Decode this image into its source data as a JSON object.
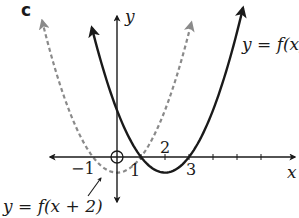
{
  "figure": {
    "panel_label": "c",
    "axes": {
      "x_label": "x",
      "y_label": "y",
      "origin_px": [
        117,
        157
      ],
      "unit_px": 24,
      "x_ticks": [
        1,
        2,
        3,
        4,
        5,
        6
      ],
      "x_tick_labels": [
        {
          "value": -1,
          "text": "−1"
        },
        {
          "value": 1,
          "text": "1"
        },
        {
          "value": 2,
          "text": "2"
        },
        {
          "value": 3,
          "text": "3"
        }
      ],
      "origin_marker": "circle"
    },
    "curves": [
      {
        "name": "f",
        "label": "y = f(x)",
        "style": "solid",
        "color": "#1a1a1a",
        "roots": [
          1,
          3
        ],
        "vertex": [
          2,
          -0.65
        ],
        "a": 0.65,
        "x_range": [
          -1.05,
          5.25
        ]
      },
      {
        "name": "f-shifted",
        "label": "y = f(x + 2)",
        "style": "dashed",
        "color": "#8a8a8a",
        "roots": [
          -1,
          1
        ],
        "vertex": [
          0,
          -0.65
        ],
        "a": 0.65,
        "x_range": [
          -3.12,
          3.1
        ]
      }
    ],
    "labels": {
      "f": "y = f(x)",
      "f_shifted": "y = f(x + 2)"
    }
  }
}
